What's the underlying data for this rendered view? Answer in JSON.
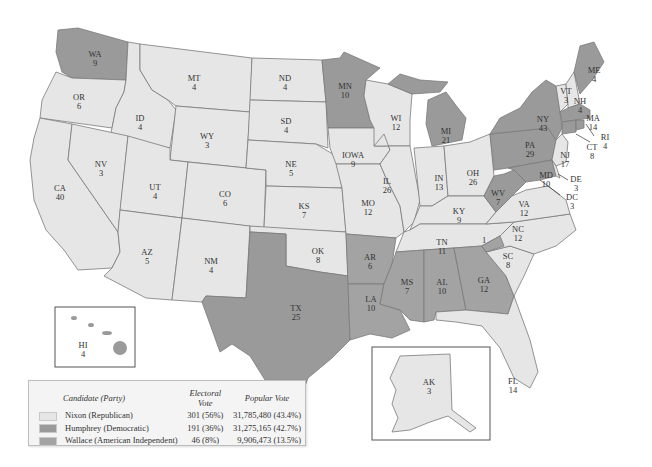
{
  "colors": {
    "nixon": "#e6e6e6",
    "humphrey": "#9a9a9a",
    "wallace": "#a3a3a3",
    "border": "#7a7a7a",
    "background": "#ffffff"
  },
  "legend": {
    "headers": {
      "candidate": "Candidate (Party)",
      "electoral": "Electoral Vote",
      "popular": "Popular Vote"
    },
    "rows": [
      {
        "candidate": "Nixon (Republican)",
        "electoral": "301 (56%)",
        "popular": "31,785,480 (43.4%)",
        "swatch": "#e6e6e6"
      },
      {
        "candidate": "Humphrey (Democratic)",
        "electoral": "191 (36%)",
        "popular": "31,275,165 (42.7%)",
        "swatch": "#9a9a9a"
      },
      {
        "candidate": "Wallace (American Independent)",
        "electoral": "46 (8%)",
        "popular": "9,906,473 (13.5%)",
        "swatch": "#a3a3a3"
      }
    ]
  },
  "states": {
    "WA": {
      "abbr": "WA",
      "ev": "9",
      "winner": "humphrey"
    },
    "OR": {
      "abbr": "OR",
      "ev": "6",
      "winner": "nixon"
    },
    "CA": {
      "abbr": "CA",
      "ev": "40",
      "winner": "nixon"
    },
    "ID": {
      "abbr": "ID",
      "ev": "4",
      "winner": "nixon"
    },
    "NV": {
      "abbr": "NV",
      "ev": "3",
      "winner": "nixon"
    },
    "MT": {
      "abbr": "MT",
      "ev": "4",
      "winner": "nixon"
    },
    "WY": {
      "abbr": "WY",
      "ev": "3",
      "winner": "nixon"
    },
    "UT": {
      "abbr": "UT",
      "ev": "4",
      "winner": "nixon"
    },
    "AZ": {
      "abbr": "AZ",
      "ev": "5",
      "winner": "nixon"
    },
    "CO": {
      "abbr": "CO",
      "ev": "6",
      "winner": "nixon"
    },
    "NM": {
      "abbr": "NM",
      "ev": "4",
      "winner": "nixon"
    },
    "ND": {
      "abbr": "ND",
      "ev": "4",
      "winner": "nixon"
    },
    "SD": {
      "abbr": "SD",
      "ev": "4",
      "winner": "nixon"
    },
    "NE": {
      "abbr": "NE",
      "ev": "5",
      "winner": "nixon"
    },
    "KS": {
      "abbr": "KS",
      "ev": "7",
      "winner": "nixon"
    },
    "OK": {
      "abbr": "OK",
      "ev": "8",
      "winner": "nixon"
    },
    "TX": {
      "abbr": "TX",
      "ev": "25",
      "winner": "humphrey"
    },
    "MN": {
      "abbr": "MN",
      "ev": "10",
      "winner": "humphrey"
    },
    "IA": {
      "abbr": "IOWA",
      "ev": "9",
      "winner": "nixon"
    },
    "MO": {
      "abbr": "MO",
      "ev": "12",
      "winner": "nixon"
    },
    "AR": {
      "abbr": "AR",
      "ev": "6",
      "winner": "wallace"
    },
    "LA": {
      "abbr": "LA",
      "ev": "10",
      "winner": "wallace"
    },
    "WI": {
      "abbr": "WI",
      "ev": "12",
      "winner": "nixon"
    },
    "IL": {
      "abbr": "IL",
      "ev": "26",
      "winner": "nixon"
    },
    "MI": {
      "abbr": "MI",
      "ev": "21",
      "winner": "humphrey"
    },
    "IN": {
      "abbr": "IN",
      "ev": "13",
      "winner": "nixon"
    },
    "OH": {
      "abbr": "OH",
      "ev": "26",
      "winner": "nixon"
    },
    "KY": {
      "abbr": "KY",
      "ev": "9",
      "winner": "nixon"
    },
    "TN": {
      "abbr": "TN",
      "ev": "11",
      "winner": "nixon"
    },
    "MS": {
      "abbr": "MS",
      "ev": "7",
      "winner": "wallace"
    },
    "AL": {
      "abbr": "AL",
      "ev": "10",
      "winner": "wallace"
    },
    "GA": {
      "abbr": "GA",
      "ev": "12",
      "winner": "wallace"
    },
    "FL": {
      "abbr": "FL",
      "ev": "14",
      "winner": "nixon"
    },
    "SC": {
      "abbr": "SC",
      "ev": "8",
      "winner": "nixon"
    },
    "NC": {
      "abbr": "NC",
      "ev": "12",
      "winner": "nixon"
    },
    "NC_faithless": {
      "abbr": "",
      "ev": "1",
      "winner": "wallace"
    },
    "VA": {
      "abbr": "VA",
      "ev": "12",
      "winner": "nixon"
    },
    "WV": {
      "abbr": "WV",
      "ev": "7",
      "winner": "humphrey"
    },
    "PA": {
      "abbr": "PA",
      "ev": "29",
      "winner": "humphrey"
    },
    "NY": {
      "abbr": "NY",
      "ev": "43",
      "winner": "humphrey"
    },
    "VT": {
      "abbr": "VT",
      "ev": "3",
      "winner": "nixon"
    },
    "NH": {
      "abbr": "NH",
      "ev": "4",
      "winner": "nixon"
    },
    "ME": {
      "abbr": "ME",
      "ev": "4",
      "winner": "humphrey"
    },
    "MA": {
      "abbr": "MA",
      "ev": "14",
      "winner": "humphrey"
    },
    "RI": {
      "abbr": "RI",
      "ev": "4",
      "winner": "humphrey"
    },
    "CT": {
      "abbr": "CT",
      "ev": "8",
      "winner": "humphrey"
    },
    "NJ": {
      "abbr": "NJ",
      "ev": "17",
      "winner": "nixon"
    },
    "DE": {
      "abbr": "DE",
      "ev": "3",
      "winner": "nixon"
    },
    "MD": {
      "abbr": "MD",
      "ev": "10",
      "winner": "humphrey"
    },
    "DC": {
      "abbr": "DC",
      "ev": "3",
      "winner": "humphrey"
    },
    "AK": {
      "abbr": "AK",
      "ev": "3",
      "winner": "nixon"
    },
    "HI": {
      "abbr": "HI",
      "ev": "4",
      "winner": "humphrey"
    }
  }
}
